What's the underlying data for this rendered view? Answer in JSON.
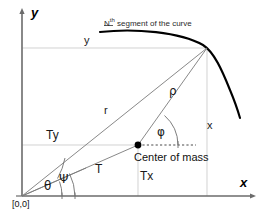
{
  "figure": {
    "type": "diagram",
    "background": "#ffffff",
    "width": 262,
    "height": 219
  },
  "axes": {
    "x_label": "x",
    "y_label": "y",
    "origin_label": "[0,0]",
    "axis_color": "#6b6b6b"
  },
  "labels": {
    "curve_caption_prefix": "N",
    "curve_caption_sup": "th",
    "curve_caption_rest": " segment of the curve",
    "y_coordinate": "y",
    "x_coordinate": "x",
    "radius_r": "r",
    "radius_rho": "ρ",
    "angle_phi": "φ",
    "angle_theta": "θ",
    "angle_psi": "Ψ",
    "tension_T": "T",
    "tension_Tx": "Tx",
    "tension_Ty": "Ty",
    "center_of_mass": "Center of mass"
  },
  "colors": {
    "curve": "#000000",
    "thin_line": "#7a7a7a",
    "guide_line": "#b9b9b9",
    "dotted_line": "#555555",
    "point": "#000000",
    "text": "#1a1a1a"
  },
  "geometry": {
    "origin": [
      22,
      196
    ],
    "curve_point": [
      207,
      48
    ],
    "center_of_mass": [
      138,
      145
    ],
    "curve_start": [
      100,
      32
    ],
    "curve_end": [
      239,
      117
    ]
  }
}
